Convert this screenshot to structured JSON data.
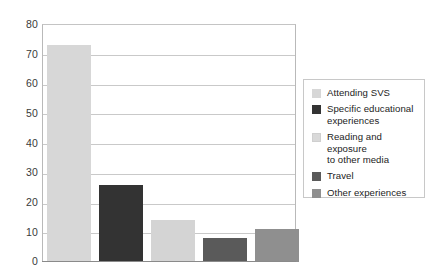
{
  "chart_data": {
    "type": "bar",
    "title": "",
    "xlabel": "",
    "ylabel": "",
    "ylim": [
      0,
      80
    ],
    "yticks": [
      "0",
      "10",
      "20",
      "30",
      "40",
      "50",
      "60",
      "70",
      "80"
    ],
    "grid": true,
    "legend_position": "right",
    "categories": [
      "Attending SVS",
      "Specific educational experiences",
      "Reading and exposure to other media",
      "Travel",
      "Other experiences"
    ],
    "values": [
      73,
      26,
      14,
      8,
      11
    ],
    "series": [
      {
        "name": "Responses",
        "values": [
          73,
          26,
          14,
          8,
          11
        ]
      }
    ],
    "bar_styles": [
      "hatched-gray",
      "solid-dark",
      "solid-light",
      "solid-medium-dark",
      "solid-medium"
    ],
    "colors": {
      "hatched-gray": "#6f6f6f",
      "solid-dark": "#333333",
      "solid-light": "#d4d4d4",
      "solid-medium-dark": "#5a5a5a",
      "solid-medium": "#8f8f8f",
      "gridline": "#c9c9c9",
      "frame": "#b9b9b9",
      "axis-text": "#3a3a3a"
    }
  },
  "axis": {
    "y_ticks": [
      {
        "label": "80"
      },
      {
        "label": "70"
      },
      {
        "label": "60"
      },
      {
        "label": "50"
      },
      {
        "label": "40"
      },
      {
        "label": "30"
      },
      {
        "label": "20"
      },
      {
        "label": "10"
      },
      {
        "label": "0"
      }
    ]
  },
  "legend": {
    "items": [
      {
        "label": "Attending SVS",
        "swatch": "hatched-gray"
      },
      {
        "label": "Specific educational\nexperiences",
        "swatch": "solid-dark"
      },
      {
        "label": "Reading and exposure\nto other media",
        "swatch": "solid-light"
      },
      {
        "label": "Travel",
        "swatch": "solid-medium-dark"
      },
      {
        "label": "Other experiences",
        "swatch": "solid-medium"
      }
    ]
  }
}
